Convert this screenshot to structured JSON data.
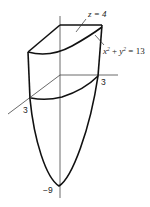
{
  "figure": {
    "type": "3d-solid-sketch",
    "labels": {
      "plane": "z = 4",
      "cylinder_x": "x",
      "cylinder_sup1": "2",
      "cylinder_plus": " + ",
      "cylinder_y": "y",
      "cylinder_sup2": "2",
      "cylinder_eq": " = 13",
      "x_axis_tick": "3",
      "y_axis_tick": "3",
      "z_axis_vertex": "−9"
    },
    "colors": {
      "stroke": "#111111",
      "axis": "#444444",
      "background": "#ffffff"
    }
  }
}
